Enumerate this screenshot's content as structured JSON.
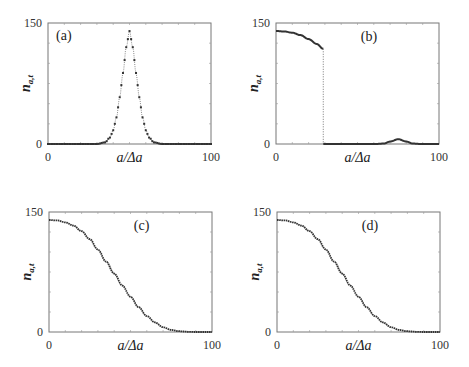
{
  "figure": {
    "panels": [
      "(a)",
      "(b)",
      "(c)",
      "(d)"
    ],
    "xlabel": "a/Δa",
    "ylabel_main": "n",
    "ylabel_sub": "a,t",
    "x_ticks": [
      "0",
      "100"
    ],
    "y_ticks": [
      "0",
      "150"
    ]
  },
  "chart_data": [
    {
      "panel": "(a)",
      "type": "scatter",
      "title": "(a)",
      "xlabel": "a/Δa",
      "ylabel": "n_{a,t}",
      "xlim": [
        0,
        100
      ],
      "ylim": [
        0,
        150
      ],
      "grid": false,
      "description": "Gaussian-shaped peak of dotted points centered at a/Δa≈50",
      "x": [
        0,
        30,
        35,
        38,
        40,
        42,
        44,
        46,
        48,
        50,
        52,
        54,
        56,
        58,
        60,
        62,
        65,
        70,
        100
      ],
      "y": [
        0,
        0,
        2,
        8,
        17,
        33,
        58,
        88,
        120,
        140,
        120,
        88,
        58,
        33,
        17,
        8,
        2,
        0,
        0
      ]
    },
    {
      "panel": "(b)",
      "type": "line",
      "title": "(b)",
      "xlabel": "a/Δa",
      "ylabel": "n_{a,t}",
      "xlim": [
        0,
        100
      ],
      "ylim": [
        0,
        150
      ],
      "grid": false,
      "description": "Flat-top decreasing curve from 140 to ~118 up to a/Δa≈29, vertical drop to 0, small bump (~6) near a/Δa≈75",
      "x": [
        0,
        5,
        10,
        15,
        20,
        25,
        29,
        29,
        40,
        60,
        66,
        70,
        75,
        80,
        84,
        90,
        100
      ],
      "y": [
        140,
        139.5,
        138,
        135,
        130,
        124,
        118,
        0,
        0,
        0,
        0.5,
        3,
        6,
        3,
        0.5,
        0,
        0
      ]
    },
    {
      "panel": "(c)",
      "type": "line",
      "title": "(c)",
      "xlabel": "a/Δa",
      "ylabel": "n_{a,t}",
      "xlim": [
        0,
        100
      ],
      "ylim": [
        0,
        150
      ],
      "grid": false,
      "description": "Smooth sigmoid decrease from 140 to 0",
      "x": [
        0,
        5,
        10,
        15,
        20,
        25,
        30,
        35,
        40,
        45,
        50,
        55,
        60,
        65,
        70,
        75,
        80,
        85,
        90,
        95,
        100
      ],
      "y": [
        140,
        139.5,
        137,
        133,
        126,
        116,
        103,
        88,
        73,
        58,
        44,
        31,
        20,
        12,
        6,
        2.5,
        1,
        0.3,
        0,
        0,
        0
      ]
    },
    {
      "panel": "(d)",
      "type": "line",
      "title": "(d)",
      "xlabel": "a/Δa",
      "ylabel": "n_{a,t}",
      "xlim": [
        0,
        100
      ],
      "ylim": [
        0,
        150
      ],
      "grid": false,
      "description": "Smooth sigmoid decrease from 140 to 0 (nearly identical to c)",
      "x": [
        0,
        5,
        10,
        15,
        20,
        25,
        30,
        35,
        40,
        45,
        50,
        55,
        60,
        65,
        70,
        75,
        80,
        85,
        90,
        95,
        100
      ],
      "y": [
        140,
        139.5,
        137,
        133,
        126,
        116,
        103,
        88,
        73,
        58,
        44,
        31,
        20,
        12,
        6,
        2.5,
        1,
        0.3,
        0,
        0,
        0
      ]
    }
  ]
}
